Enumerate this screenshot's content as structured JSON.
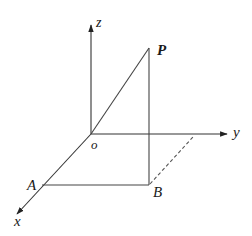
{
  "figure": {
    "type": "3d-coordinate-diagram",
    "labels": {
      "origin": "o",
      "x_axis": "x",
      "y_axis": "y",
      "z_axis": "z",
      "point_P": "P",
      "point_A": "A",
      "point_B": "B"
    },
    "points": {
      "O": [
        91,
        134
      ],
      "P": [
        149,
        48
      ],
      "A": [
        42,
        185
      ],
      "B": [
        149,
        185
      ]
    },
    "segments": [
      {
        "from": "O",
        "to": "P",
        "style": "solid"
      },
      {
        "from": "P",
        "to": "B",
        "style": "solid"
      },
      {
        "from": "A",
        "to": "B",
        "style": "solid"
      },
      {
        "from": "B",
        "to": "y-axis",
        "style": "dashed"
      }
    ],
    "colors": {
      "line": "#333333",
      "text": "#1a1a1a",
      "background": "#ffffff"
    }
  }
}
